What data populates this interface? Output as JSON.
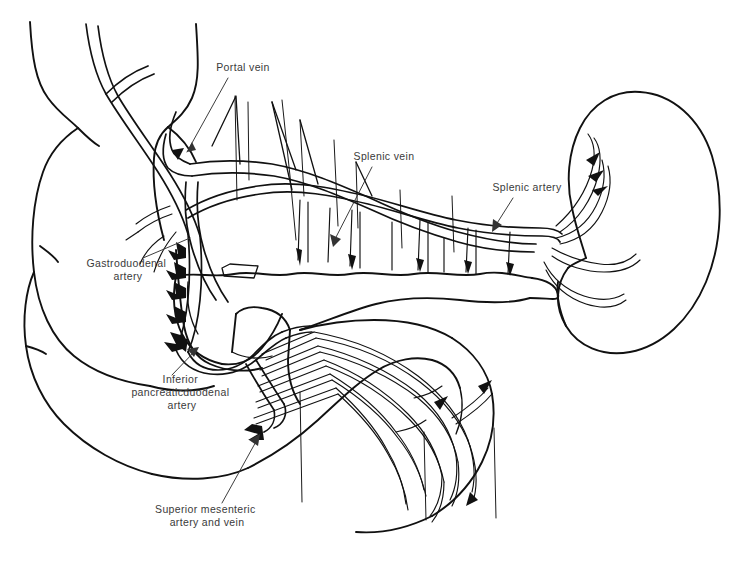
{
  "figure": {
    "type": "anatomical-line-drawing",
    "background_color": "#ffffff",
    "ink_color": "#111111",
    "label_color": "#3a3a3a",
    "width": 738,
    "height": 565
  },
  "labels": [
    {
      "id": "portal-vein",
      "lines": [
        "Portal vein"
      ],
      "text_x": 243,
      "text_y": 71,
      "leader": {
        "x1": 228,
        "y1": 78,
        "x2": 187,
        "y2": 152
      }
    },
    {
      "id": "splenic-vein",
      "lines": [
        "Splenic vein"
      ],
      "text_x": 384,
      "text_y": 160,
      "leader": {
        "x1": 372,
        "y1": 167,
        "x2": 333,
        "y2": 243
      }
    },
    {
      "id": "splenic-artery",
      "lines": [
        "Splenic artery"
      ],
      "text_x": 527,
      "text_y": 191,
      "leader": {
        "x1": 513,
        "y1": 198,
        "x2": 494,
        "y2": 228
      }
    },
    {
      "id": "gastroduodenal-artery",
      "lines": [
        "Gastroduodenal",
        "artery"
      ],
      "text_x": 128,
      "text_y": 267,
      "leader": {
        "x1": 143,
        "y1": 258,
        "x2": 183,
        "y2": 236
      }
    },
    {
      "id": "inferior-pancreaticoduodenal-artery",
      "lines": [
        "Inferior",
        "pancreaticduodenal",
        "artery"
      ],
      "text_x": 182,
      "text_y": 383,
      "leader": {
        "x1": 172,
        "y1": 375,
        "x2": 196,
        "y2": 350
      }
    },
    {
      "id": "superior-mesenteric-artery-and-vein",
      "lines": [
        "Superior mesenteric",
        "artery and vein"
      ],
      "text_x": 207,
      "text_y": 513,
      "leader": {
        "x1": 222,
        "y1": 503,
        "x2": 257,
        "y2": 439
      }
    }
  ],
  "structures": [
    {
      "id": "duodenum",
      "name": "Duodenum (C-loop)"
    },
    {
      "id": "pancreas",
      "name": "Pancreas body and tail"
    },
    {
      "id": "spleen",
      "name": "Spleen"
    },
    {
      "id": "jejunum",
      "name": "Proximal jejunum"
    },
    {
      "id": "splenic-vessels",
      "name": "Splenic artery and vein"
    },
    {
      "id": "portal-vein-trunk",
      "name": "Portal vein"
    },
    {
      "id": "gastroduodenal-artery-vessel",
      "name": "Gastroduodenal artery"
    },
    {
      "id": "ipda-vessel",
      "name": "Inferior pancreaticoduodenal artery"
    },
    {
      "id": "sma-smv",
      "name": "Superior mesenteric artery and vein"
    }
  ]
}
